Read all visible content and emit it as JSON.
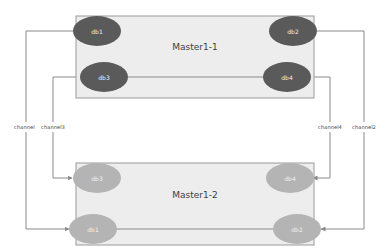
{
  "diagram": {
    "colors": {
      "box_fill": "#ededed",
      "box_stroke": "#9a9a9a",
      "node_dark": "#5a5a5a",
      "node_light": "#b4b4b4",
      "edge": "#8a8a8a",
      "label_text": "#4a4a4a",
      "node_text": "#f2f2f2",
      "background": "#ffffff"
    },
    "groups": [
      {
        "id": "master1-1",
        "label": "Master1-1",
        "tone": "dark",
        "nodes": [
          {
            "id": "m1-db1",
            "label": "db1",
            "row": "top",
            "side": "left"
          },
          {
            "id": "m1-db2",
            "label": "db2",
            "row": "top",
            "side": "right"
          },
          {
            "id": "m1-db3",
            "label": "db3",
            "row": "bottom",
            "side": "left"
          },
          {
            "id": "m1-db4",
            "label": "db4",
            "row": "bottom",
            "side": "right"
          }
        ]
      },
      {
        "id": "master1-2",
        "label": "Master1-2",
        "tone": "light",
        "nodes": [
          {
            "id": "m2-db3",
            "label": "db3",
            "row": "top",
            "side": "left"
          },
          {
            "id": "m2-db4",
            "label": "db4",
            "row": "top",
            "side": "right"
          },
          {
            "id": "m2-db1",
            "label": "db1",
            "row": "bottom",
            "side": "left"
          },
          {
            "id": "m2-db2",
            "label": "db2",
            "row": "bottom",
            "side": "right"
          }
        ]
      }
    ],
    "channels": [
      {
        "id": "channel1",
        "label": "channel1",
        "from": "m1-db1",
        "to": "m2-db1",
        "side": "left",
        "lane": "outer"
      },
      {
        "id": "channel3",
        "label": "channel3",
        "from": "m1-db3",
        "to": "m2-db3",
        "side": "left",
        "lane": "inner"
      },
      {
        "id": "channel4",
        "label": "channel4",
        "from": "m1-db4",
        "to": "m2-db4",
        "side": "right",
        "lane": "inner"
      },
      {
        "id": "channel2",
        "label": "channel2",
        "from": "m1-db2",
        "to": "m2-db2",
        "side": "right",
        "lane": "outer"
      }
    ]
  }
}
